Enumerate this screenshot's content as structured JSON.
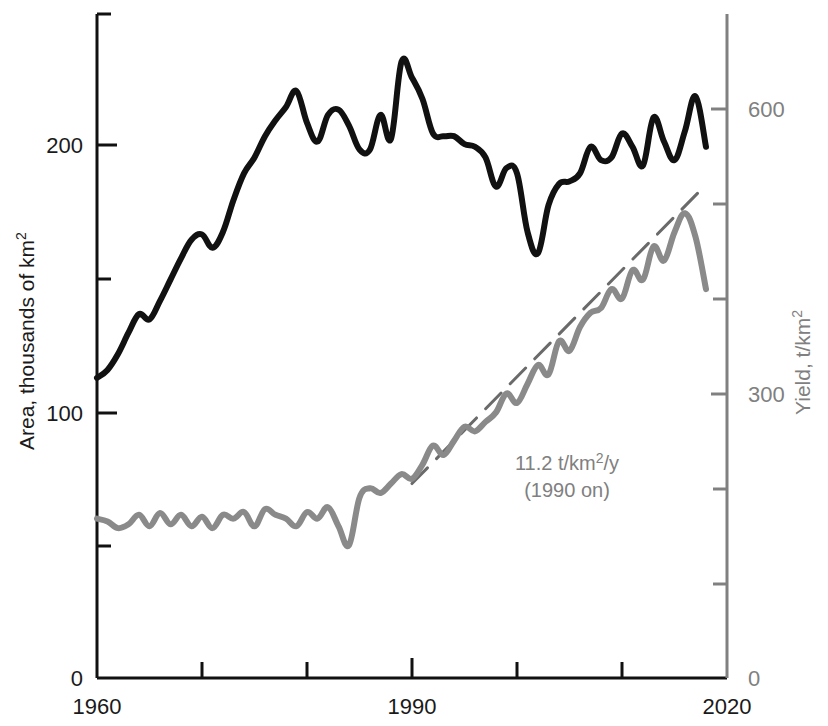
{
  "chart_data": {
    "type": "line",
    "title": "",
    "xlabel": "",
    "x_tick_labels": [
      "1960",
      "",
      "",
      "1990",
      "",
      "",
      "2020"
    ],
    "x_ticks": [
      1960,
      1970,
      1980,
      1990,
      2000,
      2010,
      2020
    ],
    "xlim": [
      1960,
      2020
    ],
    "grid": false,
    "legend": "none",
    "axes": {
      "left": {
        "label_main": "Area, thousands of km",
        "label_sup": "2",
        "ylim": [
          0,
          250
        ],
        "ticks": [
          0,
          50,
          100,
          150,
          200,
          250
        ],
        "tick_labels": [
          "0",
          "",
          "100",
          "",
          "200",
          ""
        ],
        "color": "#1a1a1a"
      },
      "right": {
        "label_main": "Yield, t/km",
        "label_sup": "2",
        "ylim": [
          0,
          700
        ],
        "ticks": [
          0,
          100,
          200,
          300,
          400,
          500,
          600,
          700
        ],
        "tick_labels": [
          "0",
          "",
          "",
          "300",
          "",
          "",
          "600",
          ""
        ],
        "color": "#808080"
      }
    },
    "series": [
      {
        "name": "Area",
        "axis": "left",
        "color": "#111111",
        "units": "thousands of km^2",
        "x": [
          1960,
          1961,
          1962,
          1963,
          1964,
          1965,
          1966,
          1967,
          1968,
          1969,
          1970,
          1971,
          1972,
          1973,
          1974,
          1975,
          1976,
          1977,
          1978,
          1979,
          1980,
          1981,
          1982,
          1983,
          1984,
          1985,
          1986,
          1987,
          1988,
          1989,
          1990,
          1991,
          1992,
          1993,
          1994,
          1995,
          1996,
          1997,
          1998,
          1999,
          2000,
          2001,
          2002,
          2003,
          2004,
          2005,
          2006,
          2007,
          2008,
          2009,
          2010,
          2011,
          2012,
          2013,
          2014,
          2015,
          2016,
          2017,
          2018
        ],
        "values": [
          113,
          116,
          122,
          130,
          137,
          135,
          142,
          150,
          158,
          165,
          167,
          162,
          168,
          180,
          190,
          196,
          204,
          210,
          215,
          221,
          209,
          202,
          212,
          214,
          208,
          199,
          199,
          212,
          203,
          232,
          226,
          218,
          205,
          204,
          204,
          201,
          200,
          196,
          185,
          192,
          190,
          168,
          160,
          178,
          186,
          187,
          190,
          200,
          195,
          196,
          205,
          200,
          193,
          211,
          202,
          195,
          206,
          219,
          200
        ]
      },
      {
        "name": "Yield",
        "axis": "right",
        "color": "#8a8a8a",
        "units": "t/km^2",
        "x": [
          1960,
          1961,
          1962,
          1963,
          1964,
          1965,
          1966,
          1967,
          1968,
          1969,
          1970,
          1971,
          1972,
          1973,
          1974,
          1975,
          1976,
          1977,
          1978,
          1979,
          1980,
          1981,
          1982,
          1983,
          1984,
          1985,
          1986,
          1987,
          1988,
          1989,
          1990,
          1991,
          1992,
          1993,
          1994,
          1995,
          1996,
          1997,
          1998,
          1999,
          2000,
          2001,
          2002,
          2003,
          2004,
          2005,
          2006,
          2007,
          2008,
          2009,
          2010,
          2011,
          2012,
          2013,
          2014,
          2015,
          2016,
          2017,
          2018
        ],
        "values": [
          168,
          165,
          158,
          162,
          172,
          160,
          174,
          162,
          172,
          160,
          170,
          158,
          172,
          168,
          175,
          160,
          178,
          172,
          168,
          160,
          175,
          168,
          180,
          160,
          140,
          190,
          200,
          195,
          205,
          215,
          210,
          225,
          245,
          235,
          250,
          265,
          260,
          270,
          280,
          300,
          290,
          310,
          330,
          320,
          355,
          345,
          370,
          385,
          390,
          410,
          400,
          430,
          420,
          455,
          440,
          470,
          490,
          465,
          410
        ]
      }
    ],
    "trend": {
      "name": "yield-trend",
      "color": "#6a6a6a",
      "style": "dashed",
      "label_line1_prefix": "11.2 t/km",
      "label_line1_sup": "2",
      "label_line1_suffix": "/y",
      "label_line2": "(1990 on)",
      "slope_value": 11.2,
      "slope_units": "t/km^2/y",
      "start_year": 1990,
      "end_year": 2018,
      "start_value": 205,
      "end_value": 520
    }
  }
}
